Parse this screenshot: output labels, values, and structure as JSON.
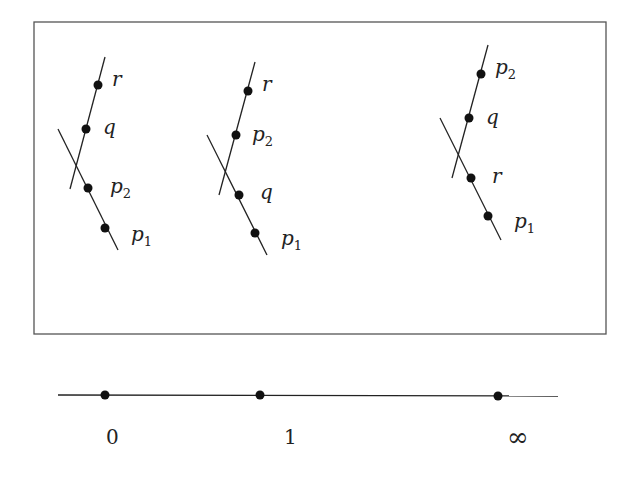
{
  "figure": {
    "configurations": [
      {
        "name": "config-0",
        "upper_line_points": [
          {
            "label": "r",
            "sub": ""
          },
          {
            "label": "q",
            "sub": ""
          }
        ],
        "lower_line_points": [
          {
            "label": "p",
            "sub": "2"
          },
          {
            "label": "p",
            "sub": "1"
          }
        ]
      },
      {
        "name": "config-1",
        "upper_line_points": [
          {
            "label": "r",
            "sub": ""
          },
          {
            "label": "p",
            "sub": "2"
          }
        ],
        "lower_line_points": [
          {
            "label": "q",
            "sub": ""
          },
          {
            "label": "p",
            "sub": "1"
          }
        ]
      },
      {
        "name": "config-infinity",
        "upper_line_points": [
          {
            "label": "p",
            "sub": "2"
          },
          {
            "label": "q",
            "sub": ""
          }
        ],
        "lower_line_points": [
          {
            "label": "r",
            "sub": ""
          },
          {
            "label": "p",
            "sub": "1"
          }
        ]
      }
    ],
    "base_line": {
      "points": [
        {
          "label": "0"
        },
        {
          "label": "1"
        },
        {
          "label": "∞"
        }
      ]
    }
  }
}
